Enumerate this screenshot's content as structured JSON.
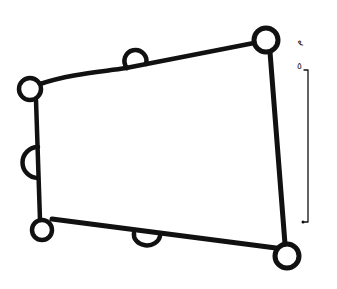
{
  "diagram": {
    "type": "hand-drawn fortification plan",
    "stroke_color": "#111111",
    "background": "#ffffff",
    "enclosure": {
      "corners": [
        {
          "name": "north-west",
          "x": 30,
          "y": 89
        },
        {
          "name": "north-east",
          "x": 266,
          "y": 40
        },
        {
          "name": "south-east",
          "x": 287,
          "y": 256
        },
        {
          "name": "south-west",
          "x": 42,
          "y": 230
        }
      ]
    },
    "corner_towers": [
      {
        "name": "north-west-tower",
        "cx": 30,
        "cy": 89,
        "r": 11
      },
      {
        "name": "north-east-tower",
        "cx": 266,
        "cy": 40,
        "r": 12
      },
      {
        "name": "south-east-tower",
        "cx": 287,
        "cy": 256,
        "r": 12
      },
      {
        "name": "south-west-tower",
        "cx": 42,
        "cy": 230,
        "r": 10
      }
    ],
    "intermediate_towers": [
      {
        "name": "north-wall-tower",
        "cx": 136,
        "cy": 58,
        "r": 11
      },
      {
        "name": "west-wall-tower",
        "cx": 36,
        "cy": 162,
        "r": 15
      },
      {
        "name": "south-wall-tower",
        "cx": 147,
        "cy": 238,
        "r": 12
      }
    ],
    "scale_bar": {
      "x": 308,
      "y_top": 70,
      "y_bottom": 222,
      "label_unit": "م",
      "label_value": "٥"
    }
  }
}
